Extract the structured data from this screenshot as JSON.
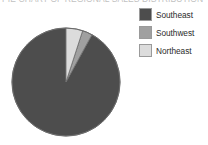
{
  "title_strip": {
    "clipped_text": "PIE CHART OF REGIONAL SALES DISTRIBUTION"
  },
  "legend": {
    "position": "right",
    "items": [
      {
        "label": "Southeast",
        "color": "#4d4d4d"
      },
      {
        "label": "Southwest",
        "color": "#a0a0a0"
      },
      {
        "label": "Northeast",
        "color": "#dcdcdc"
      }
    ]
  },
  "chart_data": {
    "type": "pie",
    "title": "",
    "categories": [
      "Southeast",
      "Southwest",
      "Northeast"
    ],
    "values": [
      92,
      3,
      5
    ],
    "colors": [
      "#4d4d4d",
      "#a0a0a0",
      "#dcdcdc"
    ],
    "start_angle": 0,
    "direction": "clockwise",
    "slice_order_from_top_clockwise": [
      "Northeast",
      "Southwest",
      "Southeast"
    ],
    "legend_position": "right",
    "grid": false,
    "labels_shown": false,
    "xlabel": "",
    "ylabel": ""
  },
  "geometry": {
    "center_x": 55,
    "center_y": 61,
    "radius": 54,
    "outline_color": "#6b6b6b"
  }
}
